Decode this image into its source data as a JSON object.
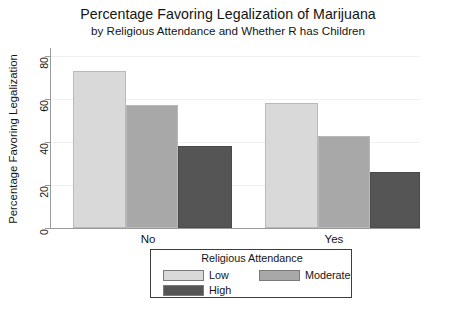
{
  "chart_data": {
    "type": "bar",
    "title": "Percentage Favoring Legalization of Marijuana",
    "subtitle": "by Religious Attendance and Whether R has Children",
    "xlabel": "",
    "ylabel": "Percentage Favoring Legalization",
    "categories": [
      "No",
      "Yes"
    ],
    "series": [
      {
        "name": "Low",
        "values": [
          73,
          58
        ],
        "color": "#d9d9d9"
      },
      {
        "name": "Moderate",
        "values": [
          57,
          43
        ],
        "color": "#a8a8a8"
      },
      {
        "name": "High",
        "values": [
          38,
          26
        ],
        "color": "#555555"
      }
    ],
    "ylim": [
      0,
      80
    ],
    "yticks": [
      0,
      20,
      40,
      60,
      80
    ],
    "ytick_labels": [
      "0",
      "20",
      "40",
      "60",
      "80"
    ],
    "grid": true,
    "legend_position": "bottom",
    "legend_title": "Religious Attendance"
  },
  "legend": {
    "title": "Religious Attendance",
    "entries": [
      {
        "label": "Low",
        "color": "#d9d9d9"
      },
      {
        "label": "Moderate",
        "color": "#a8a8a8"
      },
      {
        "label": "High",
        "color": "#555555"
      }
    ]
  },
  "axis": {
    "y_title": "Percentage Favoring Legalization",
    "y_ticks": [
      "0",
      "20",
      "40",
      "60",
      "80"
    ],
    "x_ticks": [
      "No",
      "Yes"
    ]
  },
  "colors": {
    "low": "#d9d9d9",
    "moderate": "#a8a8a8",
    "high": "#555555",
    "axis": "#9a9a9a",
    "grid": "#f0f0f0",
    "text": "#141414"
  }
}
